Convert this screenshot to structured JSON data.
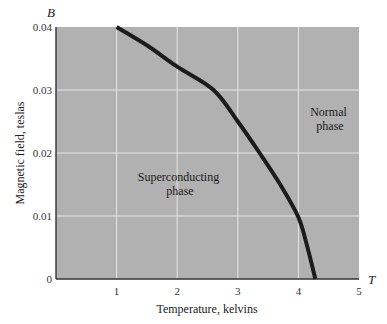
{
  "chart_data": {
    "type": "line",
    "title": "",
    "xlabel": "Temperature, kelvins",
    "ylabel": "Magnetic field, teslas",
    "x_axis_symbol": "T",
    "y_axis_symbol": "B",
    "xlim": [
      0,
      5
    ],
    "ylim": [
      0,
      0.04
    ],
    "x_ticks": [
      "1",
      "2",
      "3",
      "4",
      "5"
    ],
    "y_ticks": [
      "0",
      "0.01",
      "0.02",
      "0.03",
      "0.04"
    ],
    "grid": true,
    "series": [
      {
        "name": "Critical field curve",
        "x": [
          1.0,
          1.5,
          2.0,
          2.6,
          3.0,
          3.36,
          3.7,
          4.0,
          4.15,
          4.28
        ],
        "y": [
          0.04,
          0.0371,
          0.0337,
          0.03,
          0.025,
          0.02,
          0.015,
          0.0098,
          0.005,
          0.0
        ]
      }
    ],
    "annotations": [
      {
        "text": "Superconducting phase",
        "x": 2.3,
        "y": 0.0125
      },
      {
        "text": "Normal phase",
        "x": 4.5,
        "y": 0.021
      }
    ],
    "colors": {
      "plot_background": "#b1b1b1",
      "grid": "#e6e6e6",
      "curve": "#1c1c1c",
      "axis": "#333333"
    }
  },
  "labels": {
    "y_symbol": "B",
    "x_symbol": "T",
    "ylabel": "Magnetic field, teslas",
    "xlabel": "Temperature, kelvins",
    "superconducting_line1": "Superconducting",
    "superconducting_line2": "phase",
    "normal_line1": "Normal",
    "normal_line2": "phase",
    "yticks": [
      "0",
      "0.01",
      "0.02",
      "0.03",
      "0.04"
    ],
    "xticks": [
      "1",
      "2",
      "3",
      "4",
      "5"
    ]
  }
}
